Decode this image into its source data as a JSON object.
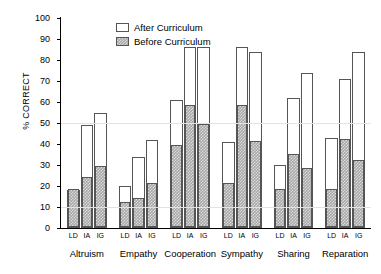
{
  "chart_data": {
    "type": "bar",
    "title": "",
    "xlabel": "",
    "ylabel": "% CORRECT",
    "ylim": [
      0,
      100
    ],
    "ytick_step": 10,
    "yticks": [
      0,
      10,
      20,
      30,
      40,
      50,
      60,
      70,
      80,
      90,
      100
    ],
    "grid": false,
    "legend_position": "top-left-inside",
    "stacked_style": "overlay",
    "legend": [
      {
        "label": "After Curriculum",
        "swatch": "white-open"
      },
      {
        "label": "Before Curriculum",
        "swatch": "gray-hatched"
      }
    ],
    "series": [
      {
        "name": "After Curriculum",
        "values": [
          18,
          49,
          55,
          20,
          34,
          42,
          61,
          86,
          86,
          41,
          86,
          84,
          30,
          62,
          74,
          43,
          71,
          84
        ]
      },
      {
        "name": "Before Curriculum",
        "values": [
          18,
          24,
          29,
          12,
          14,
          21,
          39,
          58,
          49,
          21,
          58,
          41,
          18,
          35,
          28,
          18,
          42,
          32
        ]
      }
    ],
    "group_labels": [
      "Altruism",
      "Empathy",
      "Cooperation",
      "Sympathy",
      "Sharing",
      "Reparation"
    ],
    "subgroup_labels": [
      "LD",
      "IA",
      "IG"
    ],
    "categories": [
      "Altruism LD",
      "Altruism IA",
      "Altruism IG",
      "Empathy LD",
      "Empathy IA",
      "Empathy IG",
      "Cooperation LD",
      "Cooperation IA",
      "Cooperation IG",
      "Sympathy LD",
      "Sympathy IA",
      "Sympathy IG",
      "Sharing LD",
      "Sharing IA",
      "Sharing IG",
      "Reparation LD",
      "Reparation IA",
      "Reparation IG"
    ],
    "colors": {
      "after": "#ffffff",
      "before": "#a8a8a8",
      "outline": "#555555",
      "axis": "#000000"
    }
  }
}
